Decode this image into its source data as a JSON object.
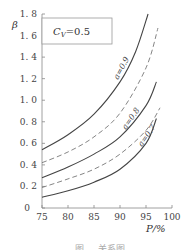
{
  "chart_data": {
    "type": "line",
    "title": "",
    "legend_box": "C_V = 0.5",
    "xlabel": "P/%",
    "ylabel": "β",
    "xlim": [
      75,
      100
    ],
    "ylim": [
      0,
      1.8
    ],
    "x_ticks": [
      "75",
      "80",
      "85",
      "90",
      "95",
      "100"
    ],
    "y_ticks": [
      "0",
      "0.2",
      "0.4",
      "0.6",
      "0.8",
      "1.0",
      "1.2",
      "1.4",
      "1.6",
      "1.8"
    ],
    "grid": false,
    "series": [
      {
        "name": "a=0.9",
        "style": "solid",
        "x": [
          75,
          80,
          85,
          90,
          93,
          95.4
        ],
        "values": [
          0.54,
          0.68,
          0.87,
          1.17,
          1.45,
          1.8
        ]
      },
      {
        "name": "dashed (between 0.9 and 0.8)",
        "style": "dashed",
        "x": [
          75,
          80,
          85,
          90,
          95,
          97.3
        ],
        "values": [
          0.42,
          0.52,
          0.66,
          0.88,
          1.3,
          1.67
        ]
      },
      {
        "name": "a=0.8",
        "style": "solid",
        "x": [
          75,
          80,
          85,
          90,
          95,
          97
        ],
        "values": [
          0.28,
          0.38,
          0.5,
          0.66,
          0.95,
          1.17
        ]
      },
      {
        "name": "dashed (between 0.8 and 0.7)",
        "style": "dashed",
        "x": [
          75,
          80,
          85,
          90,
          95,
          97.7
        ],
        "values": [
          0.19,
          0.27,
          0.36,
          0.5,
          0.72,
          0.93
        ]
      },
      {
        "name": "a=0.7",
        "style": "solid",
        "x": [
          75,
          80,
          85,
          90,
          95,
          97
        ],
        "values": [
          0.1,
          0.16,
          0.24,
          0.36,
          0.6,
          0.83
        ]
      }
    ],
    "annotations": [
      "a=0.9",
      "a=0.8",
      "a=0.7"
    ]
  },
  "labels": {
    "y_axis": "β",
    "x_axis": "P/%",
    "legend": "C",
    "legend_sub": "V",
    "legend_value": "=0.5",
    "curve_09": "a=0.9",
    "curve_08": "a=0.8",
    "curve_07": "a=0.7",
    "origin": "0",
    "caption": "图 … 关系图"
  }
}
